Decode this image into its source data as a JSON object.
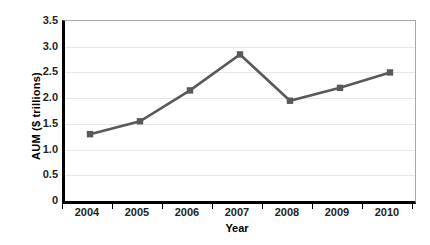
{
  "chart_data": {
    "type": "line",
    "title": "",
    "xlabel": "Year",
    "ylabel": "AUM ($ trillions)",
    "categories": [
      "2004",
      "2005",
      "2006",
      "2007",
      "2008",
      "2009",
      "2010"
    ],
    "values": [
      1.3,
      1.55,
      2.15,
      2.85,
      1.95,
      2.2,
      2.5
    ],
    "series": [
      {
        "name": "AUM",
        "values": [
          1.3,
          1.55,
          2.15,
          2.85,
          1.95,
          2.2,
          2.5
        ]
      }
    ],
    "ylim": [
      0,
      3.5
    ],
    "y_ticks": [
      "3.5",
      "3.0",
      "2.5",
      "2.0",
      "1.5",
      "1.0",
      "0.5",
      "0"
    ],
    "y_tick_values": [
      3.5,
      3.0,
      2.5,
      2.0,
      1.5,
      1.0,
      0.5,
      0
    ],
    "x_ticks": [
      "2004",
      "2005",
      "2006",
      "2007",
      "2008",
      "2009",
      "2010"
    ],
    "grid": "horizontal",
    "legend": "none",
    "marker": "square",
    "colors": {
      "line": "#58595b",
      "marker": "#58595b",
      "gridline": "#e6e7e8",
      "axis": "#000000",
      "plot_border": "#a7a9ac",
      "text": "#231f20",
      "background": "#ffffff"
    }
  },
  "footnote": {
    "text": ""
  }
}
